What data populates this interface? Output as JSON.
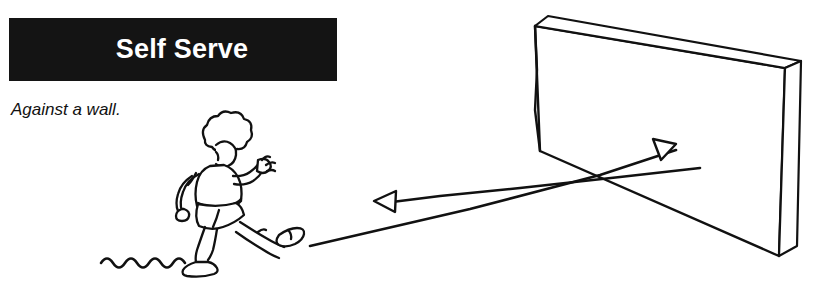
{
  "page": {
    "width": 827,
    "height": 290,
    "background_color": "#ffffff",
    "ink_color": "#111111"
  },
  "banner": {
    "title": "Self Serve",
    "background_color": "#141414",
    "text_color": "#ffffff"
  },
  "caption": {
    "text": "Against a wall."
  },
  "illustration": {
    "name": "boy-kicking-ball-against-wall",
    "figure_label": "running child kicking a ball",
    "ground_label": "wavy ground line",
    "wall_label": "3d wall slab",
    "arrow_to_wall_label": "ball path toward wall",
    "arrow_from_wall_label": "ball rebound path from wall"
  }
}
